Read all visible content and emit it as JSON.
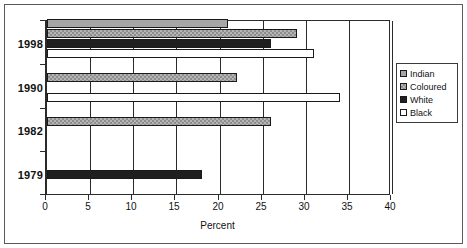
{
  "chart_data": {
    "type": "bar",
    "orientation": "horizontal",
    "title": "",
    "xlabel": "Percent",
    "ylabel": "",
    "xlim": [
      0,
      40
    ],
    "xticks": [
      0,
      5,
      10,
      15,
      20,
      25,
      30,
      35,
      40
    ],
    "xtick_labels": [
      "0",
      "5",
      "10",
      "15",
      "20",
      "25",
      "30",
      "35",
      "40"
    ],
    "categories": [
      "1998",
      "1990",
      "1982",
      "1979"
    ],
    "grid": true,
    "grid_axis": "x",
    "legend_position": "right",
    "series": [
      {
        "name": "Indian",
        "color": "#a6a6a6",
        "values": [
          21,
          null,
          null,
          null
        ]
      },
      {
        "name": "Coloured",
        "color": "#b4b4b4",
        "values": [
          29,
          22,
          26,
          null
        ]
      },
      {
        "name": "White",
        "color": "#1f1f1f",
        "values": [
          26,
          null,
          null,
          18
        ]
      },
      {
        "name": "Black",
        "color": "#ffffff",
        "values": [
          31,
          34,
          null,
          null
        ]
      }
    ]
  },
  "legend": {
    "items": [
      {
        "label": "Indian",
        "swatch": "legend-swatch-indian"
      },
      {
        "label": "Coloured",
        "swatch": "legend-swatch-coloured"
      },
      {
        "label": "White",
        "swatch": "legend-swatch-white"
      },
      {
        "label": "Black",
        "swatch": "legend-swatch-black"
      }
    ]
  },
  "axis": {
    "x_title": "Percent",
    "x_tick_labels": [
      "0",
      "5",
      "10",
      "15",
      "20",
      "25",
      "30",
      "35",
      "40"
    ],
    "y_tick_labels": [
      "1998",
      "1990",
      "1982",
      "1979"
    ]
  }
}
